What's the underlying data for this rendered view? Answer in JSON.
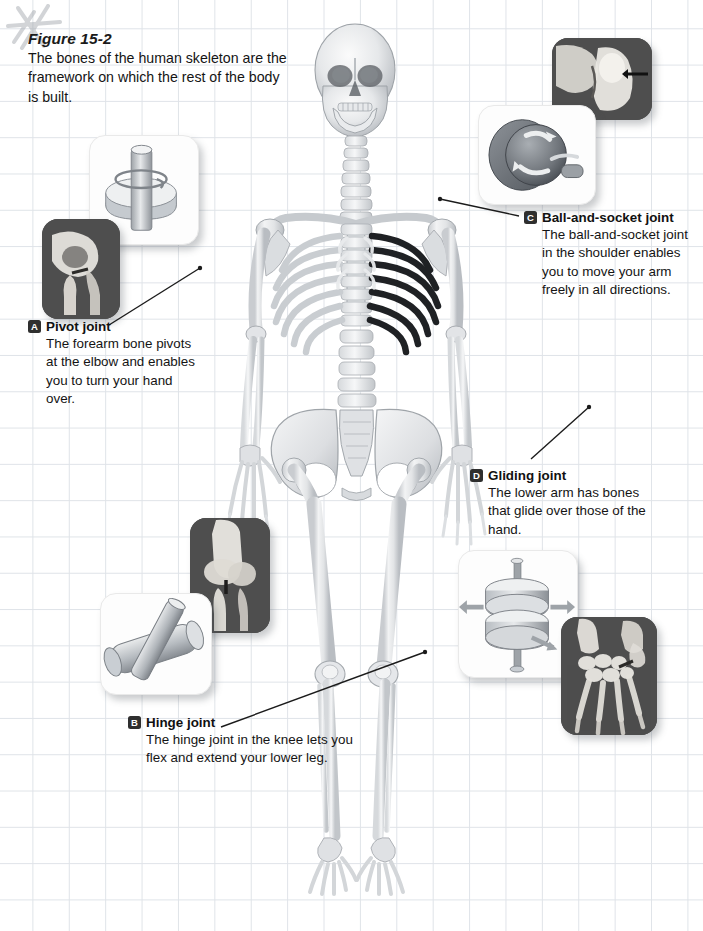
{
  "figure": {
    "number_label": "Figure 15-2",
    "caption": "The bones of the human skeleton are the framework on which the rest of the body is built."
  },
  "decoration": {
    "corner_mark": "asterisk-doodle-mark"
  },
  "illustration": {
    "main_subject": "human-skeleton-anterior-view",
    "alt": "Full human skeleton shown from the front, with highlighted dark ribs and sternum"
  },
  "callouts": [
    {
      "id": "A",
      "badge": "A",
      "title": "Pivot joint",
      "body": "The forearm bone pivots at the elbow and enables you to turn your hand over.",
      "target": "left-elbow",
      "panels": [
        {
          "kind": "light",
          "name": "pivot-joint-model-panel",
          "icon": "pivot-mechanical-model"
        },
        {
          "kind": "dark",
          "name": "elbow-bone-photo-panel",
          "icon": "elbow-bone-photo"
        }
      ]
    },
    {
      "id": "B",
      "badge": "B",
      "title": "Hinge joint",
      "body": "The hinge joint in the knee lets you flex and extend your lower leg.",
      "target": "right-knee",
      "panels": [
        {
          "kind": "dark",
          "name": "knee-bone-photo-panel",
          "icon": "knee-bone-photo"
        },
        {
          "kind": "light",
          "name": "hinge-joint-model-panel",
          "icon": "hinge-mechanical-model"
        }
      ]
    },
    {
      "id": "C",
      "badge": "C",
      "title": "Ball-and-socket joint",
      "body": "The ball-and-socket joint in the shoulder enables you to move your arm freely in all directions.",
      "target": "right-shoulder",
      "panels": [
        {
          "kind": "dark",
          "name": "shoulder-bone-photo-panel",
          "icon": "shoulder-bone-photo"
        },
        {
          "kind": "light",
          "name": "ball-and-socket-model-panel",
          "icon": "ball-socket-mechanical-model"
        }
      ]
    },
    {
      "id": "D",
      "badge": "D",
      "title": "Gliding joint",
      "body": "The lower arm has bones that glide over those of the hand.",
      "target": "left-wrist",
      "panels": [
        {
          "kind": "light",
          "name": "gliding-joint-model-panel",
          "icon": "gliding-mechanical-model"
        },
        {
          "kind": "dark",
          "name": "hand-bone-photo-panel",
          "icon": "hand-bones-photo"
        }
      ]
    }
  ],
  "colors": {
    "grid_line": "#dfe3e8",
    "page_background": "#ffffff",
    "text": "#141414",
    "badge_background": "#2f2f2f",
    "leader_line": "#1b1b1b",
    "dark_panel_background": "#4e4e4e"
  },
  "page_number": ""
}
